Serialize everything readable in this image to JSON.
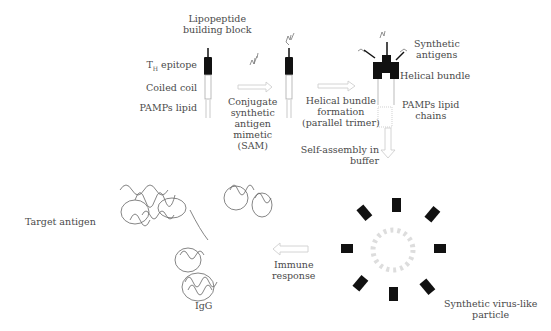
{
  "diagram": {
    "type": "process-flow",
    "building_block": {
      "title_line1": "Lipopeptide",
      "title_line2": "building block",
      "parts": [
        "TH epitope",
        "Coiled coil",
        "PAMPs lipid"
      ],
      "th_main": "T",
      "th_sub": "H",
      "th_rest": " epitope"
    },
    "steps": [
      {
        "id": "conjugate",
        "lines": [
          "Conjugate",
          "synthetic",
          "antigen",
          "mimetic",
          "(SAM)"
        ]
      },
      {
        "id": "helical",
        "lines": [
          "Helical bundle",
          "formation",
          "(parallel trimer)"
        ]
      },
      {
        "id": "selfassembly",
        "lines": [
          "Self-assembly in",
          "buffer"
        ]
      },
      {
        "id": "immune",
        "lines": [
          "Immune",
          "response"
        ]
      }
    ],
    "bundle_labels": {
      "antigens": [
        "Synthetic",
        "antigens"
      ],
      "bundle": "Helical bundle",
      "lipids": [
        "PAMPs lipid",
        "chains"
      ]
    },
    "particle_label": [
      "Synthetic virus-like",
      "particle"
    ],
    "antibody_labels": {
      "target": "Target antigen",
      "igg": "IgG"
    },
    "colors": {
      "epitope": "#111111",
      "text": "#4a4a4a",
      "arrow": "#cfcfcf",
      "lipid": "#bbbbbb"
    }
  }
}
